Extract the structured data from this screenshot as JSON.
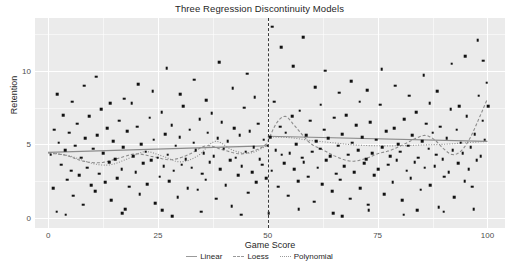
{
  "chart_data": {
    "type": "scatter",
    "title": "Three Regression Discontinuity Models",
    "xlabel": "Game Score",
    "ylabel": "Retention",
    "xlim": [
      -3,
      104
    ],
    "ylim": [
      -0.7,
      13.6
    ],
    "xticks": [
      0,
      25,
      50,
      75,
      100
    ],
    "yticks": [
      0,
      5,
      10
    ],
    "grid": true,
    "legend_position": "bottom",
    "cutoff": {
      "x": 50,
      "style": "dashed",
      "label": "50"
    },
    "legend": [
      {
        "name": "Linear",
        "style": "solid"
      },
      {
        "name": "Loess",
        "style": "dashed"
      },
      {
        "name": "Polynomial",
        "style": "dotted"
      }
    ],
    "colors": {
      "point": "#111111",
      "panel": "#ebebeb",
      "grid": "#ffffff",
      "line": "#8c8c8c",
      "cutoff": "#3a3a3a"
    },
    "points": [
      [
        0.6,
        4.3
      ],
      [
        1.1,
        2.0
      ],
      [
        1.4,
        6.0
      ],
      [
        1.9,
        0.4
      ],
      [
        2.4,
        5.1
      ],
      [
        2.9,
        3.6
      ],
      [
        3.4,
        7.0
      ],
      [
        3.9,
        4.6
      ],
      [
        4.3,
        2.6
      ],
      [
        4.8,
        5.8
      ],
      [
        5.2,
        3.2
      ],
      [
        5.7,
        1.5
      ],
      [
        6.1,
        4.9
      ],
      [
        6.6,
        6.4
      ],
      [
        7.0,
        2.9
      ],
      [
        7.5,
        4.1
      ],
      [
        8.0,
        0.9
      ],
      [
        8.4,
        5.4
      ],
      [
        8.9,
        3.4
      ],
      [
        9.3,
        6.9
      ],
      [
        9.8,
        2.2
      ],
      [
        10.3,
        4.7
      ],
      [
        10.7,
        1.8
      ],
      [
        11.2,
        5.6
      ],
      [
        11.6,
        3.0
      ],
      [
        12.1,
        7.4
      ],
      [
        12.5,
        4.4
      ],
      [
        13.0,
        2.4
      ],
      [
        13.5,
        6.1
      ],
      [
        13.9,
        3.8
      ],
      [
        14.4,
        1.2
      ],
      [
        14.8,
        5.2
      ],
      [
        15.3,
        4.0
      ],
      [
        15.7,
        2.7
      ],
      [
        16.2,
        6.6
      ],
      [
        16.7,
        3.3
      ],
      [
        17.1,
        4.8
      ],
      [
        17.6,
        0.6
      ],
      [
        18.0,
        5.9
      ],
      [
        18.5,
        2.1
      ],
      [
        19.0,
        7.8
      ],
      [
        19.4,
        4.2
      ],
      [
        19.9,
        3.1
      ],
      [
        20.3,
        6.2
      ],
      [
        20.8,
        1.6
      ],
      [
        21.2,
        5.0
      ],
      [
        21.7,
        3.7
      ],
      [
        22.2,
        4.5
      ],
      [
        22.6,
        2.3
      ],
      [
        23.1,
        6.8
      ],
      [
        23.5,
        3.9
      ],
      [
        24.0,
        5.3
      ],
      [
        24.4,
        1.0
      ],
      [
        24.9,
        4.1
      ],
      [
        25.4,
        2.8
      ],
      [
        25.8,
        7.2
      ],
      [
        26.3,
        3.5
      ],
      [
        26.7,
        5.7
      ],
      [
        27.2,
        4.3
      ],
      [
        27.6,
        2.5
      ],
      [
        28.1,
        6.3
      ],
      [
        28.6,
        3.2
      ],
      [
        29.0,
        4.9
      ],
      [
        29.5,
        1.4
      ],
      [
        29.9,
        5.5
      ],
      [
        30.4,
        3.6
      ],
      [
        30.8,
        7.6
      ],
      [
        31.3,
        4.0
      ],
      [
        31.8,
        2.0
      ],
      [
        32.2,
        6.0
      ],
      [
        32.7,
        3.4
      ],
      [
        33.1,
        5.1
      ],
      [
        33.6,
        4.6
      ],
      [
        34.0,
        1.9
      ],
      [
        34.5,
        6.7
      ],
      [
        35.0,
        3.0
      ],
      [
        35.4,
        4.4
      ],
      [
        35.9,
        2.6
      ],
      [
        36.3,
        5.8
      ],
      [
        36.8,
        3.8
      ],
      [
        37.2,
        7.1
      ],
      [
        37.7,
        4.2
      ],
      [
        38.2,
        1.3
      ],
      [
        38.6,
        5.4
      ],
      [
        39.1,
        3.3
      ],
      [
        39.5,
        6.5
      ],
      [
        40.0,
        4.7
      ],
      [
        40.4,
        2.2
      ],
      [
        40.9,
        5.2
      ],
      [
        41.4,
        3.9
      ],
      [
        41.8,
        0.8
      ],
      [
        42.3,
        6.1
      ],
      [
        42.7,
        4.1
      ],
      [
        43.2,
        2.9
      ],
      [
        43.6,
        5.6
      ],
      [
        44.1,
        3.5
      ],
      [
        44.6,
        7.5
      ],
      [
        45.0,
        4.5
      ],
      [
        45.5,
        1.7
      ],
      [
        45.9,
        5.9
      ],
      [
        46.4,
        3.1
      ],
      [
        46.8,
        4.8
      ],
      [
        47.3,
        2.4
      ],
      [
        47.8,
        6.4
      ],
      [
        48.2,
        4.0
      ],
      [
        48.7,
        3.6
      ],
      [
        49.1,
        5.3
      ],
      [
        49.6,
        2.7
      ],
      [
        50.0,
        4.9
      ],
      [
        50.5,
        5.5
      ],
      [
        50.9,
        3.2
      ],
      [
        51.4,
        7.9
      ],
      [
        51.8,
        4.6
      ],
      [
        52.3,
        2.1
      ],
      [
        52.8,
        6.2
      ],
      [
        53.2,
        4.3
      ],
      [
        53.7,
        3.7
      ],
      [
        54.1,
        5.8
      ],
      [
        54.6,
        1.5
      ],
      [
        55.0,
        4.4
      ],
      [
        55.5,
        6.9
      ],
      [
        56.0,
        3.3
      ],
      [
        56.4,
        5.0
      ],
      [
        56.9,
        2.5
      ],
      [
        57.3,
        7.3
      ],
      [
        57.8,
        4.1
      ],
      [
        58.2,
        3.8
      ],
      [
        58.7,
        5.6
      ],
      [
        59.2,
        2.8
      ],
      [
        59.6,
        6.6
      ],
      [
        60.1,
        4.5
      ],
      [
        60.5,
        1.1
      ],
      [
        61.0,
        5.2
      ],
      [
        61.4,
        3.4
      ],
      [
        61.9,
        4.7
      ],
      [
        62.4,
        2.3
      ],
      [
        62.8,
        6.0
      ],
      [
        63.3,
        3.9
      ],
      [
        63.7,
        5.4
      ],
      [
        64.2,
        4.2
      ],
      [
        64.6,
        1.8
      ],
      [
        65.1,
        6.8
      ],
      [
        65.6,
        3.0
      ],
      [
        66.0,
        4.9
      ],
      [
        66.5,
        2.6
      ],
      [
        66.9,
        5.7
      ],
      [
        67.4,
        3.5
      ],
      [
        67.8,
        7.0
      ],
      [
        68.3,
        4.3
      ],
      [
        68.8,
        1.3
      ],
      [
        69.2,
        5.1
      ],
      [
        69.7,
        3.1
      ],
      [
        70.1,
        6.3
      ],
      [
        70.6,
        4.6
      ],
      [
        71.0,
        2.0
      ],
      [
        71.5,
        5.5
      ],
      [
        72.0,
        3.7
      ],
      [
        72.4,
        4.0
      ],
      [
        72.9,
        0.9
      ],
      [
        73.3,
        6.5
      ],
      [
        73.8,
        4.4
      ],
      [
        74.2,
        2.9
      ],
      [
        74.7,
        5.3
      ],
      [
        75.2,
        3.3
      ],
      [
        75.6,
        7.7
      ],
      [
        76.1,
        4.8
      ],
      [
        76.5,
        1.6
      ],
      [
        77.0,
        5.9
      ],
      [
        77.4,
        3.6
      ],
      [
        77.9,
        4.2
      ],
      [
        78.4,
        2.4
      ],
      [
        78.8,
        6.1
      ],
      [
        79.3,
        3.9
      ],
      [
        79.7,
        5.0
      ],
      [
        80.2,
        4.5
      ],
      [
        80.6,
        1.2
      ],
      [
        81.1,
        6.7
      ],
      [
        81.6,
        3.2
      ],
      [
        82.0,
        4.9
      ],
      [
        82.5,
        2.7
      ],
      [
        82.9,
        5.6
      ],
      [
        83.4,
        3.8
      ],
      [
        83.8,
        7.2
      ],
      [
        84.3,
        4.1
      ],
      [
        84.8,
        1.9
      ],
      [
        85.2,
        5.2
      ],
      [
        85.7,
        3.4
      ],
      [
        86.1,
        6.4
      ],
      [
        86.6,
        4.7
      ],
      [
        87.0,
        2.2
      ],
      [
        87.5,
        5.8
      ],
      [
        88.0,
        3.5
      ],
      [
        88.4,
        4.3
      ],
      [
        88.9,
        0.7
      ],
      [
        89.3,
        6.2
      ],
      [
        89.8,
        4.0
      ],
      [
        90.2,
        2.8
      ],
      [
        90.7,
        5.4
      ],
      [
        91.2,
        3.1
      ],
      [
        91.6,
        7.4
      ],
      [
        92.1,
        4.6
      ],
      [
        92.5,
        1.4
      ],
      [
        93.0,
        6.0
      ],
      [
        93.4,
        3.7
      ],
      [
        93.9,
        5.1
      ],
      [
        94.4,
        4.4
      ],
      [
        94.8,
        2.5
      ],
      [
        95.3,
        6.9
      ],
      [
        95.7,
        3.3
      ],
      [
        96.2,
        4.8
      ],
      [
        96.6,
        2.1
      ],
      [
        97.1,
        5.7
      ],
      [
        97.6,
        3.9
      ],
      [
        98.0,
        8.3
      ],
      [
        98.5,
        4.2
      ],
      [
        98.9,
        6.6
      ],
      [
        99.4,
        5.3
      ],
      [
        99.8,
        9.2
      ],
      [
        100.2,
        7.6
      ],
      [
        11.0,
        9.6
      ],
      [
        17.3,
        8.1
      ],
      [
        20.5,
        9.1
      ],
      [
        23.8,
        8.6
      ],
      [
        27.0,
        10.2
      ],
      [
        30.1,
        8.4
      ],
      [
        33.3,
        9.4
      ],
      [
        36.0,
        8.0
      ],
      [
        38.9,
        10.6
      ],
      [
        42.0,
        8.8
      ],
      [
        45.3,
        9.8
      ],
      [
        47.0,
        8.2
      ],
      [
        51.0,
        13.0
      ],
      [
        53.0,
        11.6
      ],
      [
        55.8,
        10.3
      ],
      [
        58.0,
        12.3
      ],
      [
        60.8,
        8.9
      ],
      [
        63.0,
        10.0
      ],
      [
        66.2,
        8.5
      ],
      [
        69.0,
        9.3
      ],
      [
        72.6,
        8.7
      ],
      [
        75.9,
        10.1
      ],
      [
        79.0,
        9.0
      ],
      [
        82.2,
        8.3
      ],
      [
        85.5,
        9.7
      ],
      [
        88.6,
        8.6
      ],
      [
        91.9,
        10.5
      ],
      [
        95.0,
        11.0
      ],
      [
        97.8,
        12.1
      ],
      [
        99.0,
        10.7
      ],
      [
        2.0,
        8.4
      ],
      [
        5.5,
        7.9
      ],
      [
        8.2,
        9.0
      ],
      [
        14.1,
        7.8
      ],
      [
        62.0,
        7.7
      ],
      [
        70.9,
        7.9
      ],
      [
        86.9,
        7.8
      ],
      [
        93.6,
        7.6
      ],
      [
        4.0,
        0.2
      ],
      [
        16.9,
        0.3
      ],
      [
        26.0,
        0.5
      ],
      [
        34.8,
        0.4
      ],
      [
        44.0,
        0.2
      ],
      [
        57.0,
        0.6
      ],
      [
        64.9,
        0.3
      ],
      [
        73.0,
        0.5
      ],
      [
        80.9,
        0.2
      ],
      [
        90.0,
        0.4
      ],
      [
        96.9,
        0.6
      ],
      [
        28.3,
        0.1
      ],
      [
        50.2,
        0.3
      ],
      [
        67.0,
        0.1
      ],
      [
        84.0,
        0.5
      ]
    ],
    "series": [
      {
        "name": "Linear",
        "style": "solid",
        "left_segment": [
          [
            0,
            4.45
          ],
          [
            50,
            4.9
          ]
        ],
        "right_segment": [
          [
            50,
            5.55
          ],
          [
            100,
            5.2
          ]
        ]
      },
      {
        "name": "Loess",
        "style": "dashed",
        "left_points": [
          [
            0,
            4.4
          ],
          [
            4,
            4.25
          ],
          [
            8,
            3.85
          ],
          [
            12,
            3.75
          ],
          [
            16,
            4.05
          ],
          [
            20,
            4.35
          ],
          [
            24,
            4.15
          ],
          [
            28,
            3.95
          ],
          [
            32,
            4.3
          ],
          [
            36,
            4.9
          ],
          [
            40,
            4.6
          ],
          [
            44,
            4.35
          ],
          [
            48,
            4.7
          ],
          [
            50,
            5.1
          ]
        ],
        "right_points": [
          [
            50,
            5.2
          ],
          [
            52,
            6.45
          ],
          [
            54,
            6.9
          ],
          [
            56,
            6.3
          ],
          [
            58,
            5.6
          ],
          [
            60,
            5.0
          ],
          [
            63,
            4.55
          ],
          [
            66,
            4.1
          ],
          [
            69,
            3.85
          ],
          [
            72,
            4.0
          ],
          [
            75,
            4.35
          ],
          [
            78,
            4.6
          ],
          [
            81,
            5.0
          ],
          [
            84,
            5.45
          ],
          [
            86,
            5.6
          ],
          [
            88,
            5.3
          ],
          [
            90,
            4.7
          ],
          [
            92,
            4.3
          ],
          [
            94,
            4.55
          ],
          [
            96,
            5.4
          ],
          [
            98,
            6.7
          ],
          [
            100,
            8.1
          ]
        ]
      },
      {
        "name": "Polynomial",
        "style": "dotted",
        "left_points": [
          [
            0,
            4.45
          ],
          [
            5,
            4.2
          ],
          [
            10,
            3.7
          ],
          [
            14,
            3.6
          ],
          [
            18,
            4.0
          ],
          [
            22,
            4.5
          ],
          [
            26,
            4.2
          ],
          [
            30,
            3.8
          ],
          [
            34,
            4.2
          ],
          [
            38,
            5.2
          ],
          [
            42,
            4.6
          ],
          [
            46,
            4.4
          ],
          [
            50,
            4.95
          ]
        ],
        "right_points": [
          [
            50,
            5.5
          ],
          [
            55,
            5.45
          ],
          [
            60,
            5.25
          ],
          [
            65,
            5.1
          ],
          [
            70,
            4.95
          ],
          [
            75,
            4.9
          ],
          [
            80,
            4.9
          ],
          [
            85,
            4.95
          ],
          [
            90,
            5.0
          ],
          [
            95,
            5.1
          ],
          [
            100,
            5.2
          ]
        ]
      }
    ]
  }
}
